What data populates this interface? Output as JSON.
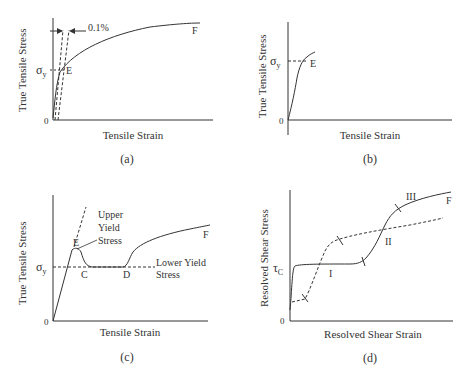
{
  "panels": {
    "a": {
      "caption": "(a)",
      "ylabel": "True Tensile Stress",
      "xlabel": "Tensile Strain",
      "zero": "0",
      "sigma": "σ",
      "sigma_sub": "y",
      "offset_label": "0.1%",
      "point_E": "E",
      "point_F": "F"
    },
    "b": {
      "caption": "(b)",
      "ylabel": "True Tensile Stress",
      "xlabel": "Tensile Strain",
      "zero": "0",
      "sigma": "σ",
      "sigma_sub": "y",
      "point_E": "E"
    },
    "c": {
      "caption": "(c)",
      "ylabel": "True Tensile Stress",
      "xlabel": "Tensile Strain",
      "zero": "0",
      "sigma": "σ",
      "sigma_sub": "y",
      "point_E": "E",
      "point_C": "C",
      "point_D": "D",
      "point_F": "F",
      "upper_1": "Upper",
      "upper_2": "Yield",
      "upper_3": "Stress",
      "lower_1": "Lower Yield",
      "lower_2": "Stress"
    },
    "d": {
      "caption": "(d)",
      "ylabel": "Resolved Shear Stress",
      "xlabel": "Resolved Shear Strain",
      "zero": "0",
      "tau": "τ",
      "tau_sub": "C",
      "stage_I": "I",
      "stage_II": "II",
      "stage_III": "III",
      "point_F": "F"
    }
  }
}
